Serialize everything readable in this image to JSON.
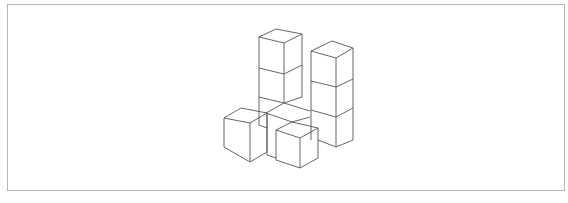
{
  "figure": {
    "stroke_color": "#555555",
    "frame_color": "#b5b5b5",
    "structures": [
      {
        "name": "left-tower",
        "cubes": 2
      },
      {
        "name": "right-tower",
        "cubes": 3
      },
      {
        "name": "left-single-cube",
        "cubes": 1
      },
      {
        "name": "front-single-cube",
        "cubes": 1
      },
      {
        "name": "center-floor-cubes",
        "cubes": 2
      }
    ]
  }
}
